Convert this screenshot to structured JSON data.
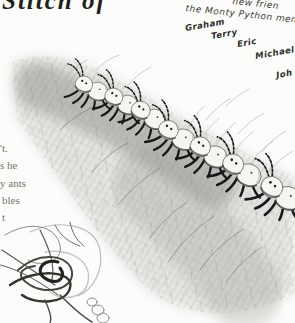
{
  "window": {
    "width": 295,
    "height": 323,
    "background": "#fcfcfa"
  },
  "heading": {
    "text_fragment": "Stitch of"
  },
  "handwritten": {
    "line_top_fragment": "new frien",
    "line_main_fragment": "the Monty Python mem",
    "names": [
      "Graham",
      "Terry",
      "Eric",
      "Michael",
      "Joh"
    ]
  },
  "body_text": {
    "fragments": [
      "'t.",
      "s he",
      "y ants",
      "bles",
      "t"
    ]
  },
  "illustration": {
    "description": "soft pencil drawing of a line of seven ants marching up a grassy mossy slope, antennae reaching forward",
    "ant_count": 7,
    "pencil_color": "#8d8d88",
    "ink_color": "#1c1c1a",
    "paper_color": "#fcfcfa"
  },
  "sketch": {
    "description": "loose gestural pencil scribble of a tangled ant in the bottom-left corner"
  }
}
